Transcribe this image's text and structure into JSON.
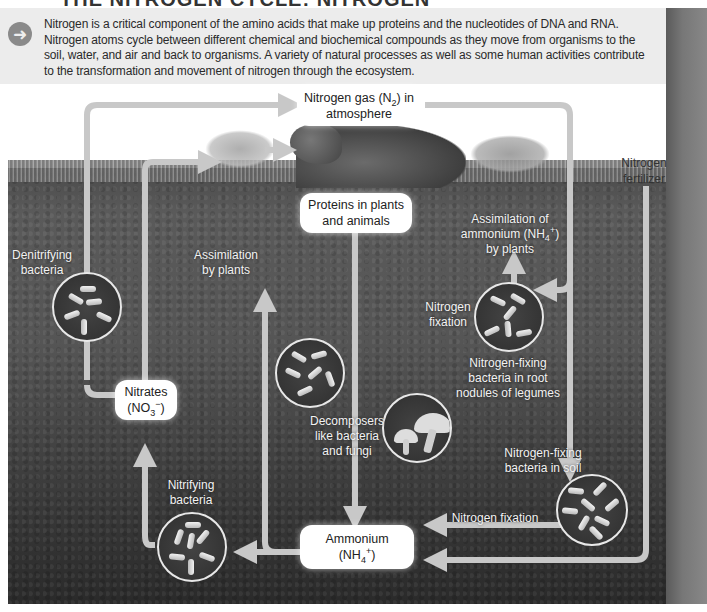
{
  "page": {
    "title_partial": "THE NITROGEN CYCLE: NITROGEN",
    "intro": {
      "icon": "arrow-right-circle-icon",
      "text": "Nitrogen is a critical component of the amino acids that make up proteins and the nucleotides of DNA and RNA. Nitrogen atoms cycle between different chemical and biochemical compounds as they move from organisms to the soil, water, and air and back to organisms. A variety of natural processes as well as some human activities contribute to the transformation and movement of nitrogen through the ecosystem."
    }
  },
  "diagram": {
    "boxes": {
      "nitrogen_gas": {
        "line1": "Nitrogen gas (N",
        "sub": "2",
        "line1_end": ") in",
        "line2": "atmosphere"
      },
      "proteins": {
        "line1": "Proteins in plants",
        "line2": "and animals"
      },
      "nitrates": {
        "line1": "Nitrates",
        "line2_pre": "(NO",
        "sub": "3",
        "sup": "−",
        "line2_end": ")"
      },
      "ammonium": {
        "line1": "Ammonium",
        "line2_pre": "(NH",
        "sub": "4",
        "sup": "+",
        "line2_end": ")"
      }
    },
    "labels": {
      "denitrifying": {
        "line1": "Denitrifying",
        "line2": "bacteria"
      },
      "assimilation_plants": {
        "line1": "Assimilation",
        "line2": "by plants"
      },
      "assimilation_ammonium": {
        "line1": "Assimilation of",
        "line2_pre": "ammonium (NH",
        "sub": "4",
        "sup": "+",
        "line2_end": ")",
        "line3": "by plants"
      },
      "nitrogen_fixation_legume": {
        "line1": "Nitrogen",
        "line2": "fixation"
      },
      "nfb_root": {
        "line1": "Nitrogen-fixing",
        "line2": "bacteria in root",
        "line3": "nodules of legumes"
      },
      "decomposers": {
        "line1": "Decomposers",
        "line2": "like bacteria",
        "line3": "and fungi"
      },
      "nfb_soil": {
        "line1": "Nitrogen-fixing",
        "line2": "bacteria in soil"
      },
      "nitrogen_fixation_soil": "Nitrogen fixation",
      "nitrifying": {
        "line1": "Nitrifying",
        "line2": "bacteria"
      },
      "fertilizer": {
        "line1": "Nitrogen",
        "line2": "fertilizer"
      }
    },
    "colors": {
      "arrow": "#c8c8c8",
      "box_bg": "#ffffff",
      "soil": "#4a4a4a",
      "label_light": "#f2f2f2"
    }
  }
}
